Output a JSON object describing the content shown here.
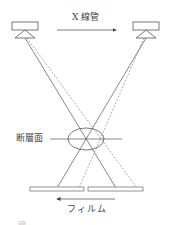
{
  "diagram": {
    "title_label": "X 線管",
    "tomography_plane_label": "断層面",
    "film_label": "フィルム",
    "caption_partial": "図 ．．．．．．．．．．",
    "colors": {
      "line": "#555555",
      "background": "#ffffff"
    },
    "nodes": [
      {
        "id": "xray-tube-left",
        "type": "x-ray tube",
        "position": "top-left"
      },
      {
        "id": "xray-tube-right",
        "type": "x-ray tube",
        "position": "top-right"
      },
      {
        "id": "tomography-plane",
        "type": "ellipse with horizontal line",
        "label": "断層面"
      },
      {
        "id": "film-left",
        "type": "film segment"
      },
      {
        "id": "film-right",
        "type": "film segment"
      }
    ],
    "edges": [
      {
        "from": "xray-tube-left",
        "to": "film-right",
        "style": "solid",
        "note": "central ray through focal plane"
      },
      {
        "from": "xray-tube-right",
        "to": "film-left",
        "style": "solid",
        "note": "central ray through focal plane"
      },
      {
        "from": "xray-tube-left",
        "to": "film-right",
        "style": "dashed",
        "note": "off-plane ray"
      },
      {
        "from": "xray-tube-right",
        "to": "film-left",
        "style": "dashed",
        "note": "off-plane ray"
      }
    ],
    "arrows": [
      {
        "id": "tube-motion-arrow",
        "direction": "right",
        "label": "X 線管"
      },
      {
        "id": "film-motion-arrow",
        "direction": "left",
        "label": "フィルム"
      }
    ]
  }
}
